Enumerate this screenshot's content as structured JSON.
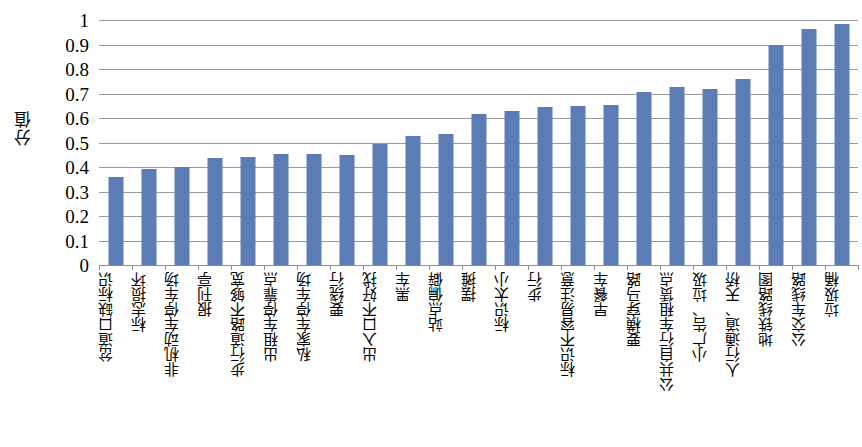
{
  "chart_data": {
    "type": "bar",
    "title": "",
    "subtitle": "",
    "xlabel": "",
    "ylabel": "分值",
    "ylim": [
      0,
      1
    ],
    "ytick_labels": [
      "1",
      "0.9",
      "0.8",
      "0.7",
      "0.6",
      "0.5",
      "0.4",
      "0.3",
      "0.2",
      "0.1",
      "0"
    ],
    "ytick_values": [
      1,
      0.9,
      0.8,
      0.7,
      0.6,
      0.5,
      0.4,
      0.3,
      0.2,
      0.1,
      0
    ],
    "grid": true,
    "legend": null,
    "legend_position": "none",
    "bar_color": "#5b7cb4",
    "gridline_color": "#9a9a9a",
    "categories": [
      "岔道口缺标识",
      "标志损坏",
      "非机动车停车场",
      "报刊亭",
      "步行道路不够宽",
      "出租车停靠点",
      "私家车停车场",
      "要绕行",
      "出入口不好找",
      "黑车",
      "站点偏僻",
      "摆摊",
      "标识太小",
      "步行",
      "标识不容易注意",
      "早餐车",
      "要横穿马路",
      "公共自行车租赁点",
      "小广告、垃圾",
      "人行通道、天桥",
      "地铁线路图",
      "公交车线路",
      "垃圾桶"
    ],
    "values": [
      0.36,
      0.39,
      0.4,
      0.435,
      0.44,
      0.455,
      0.455,
      0.45,
      0.495,
      0.525,
      0.535,
      0.615,
      0.63,
      0.645,
      0.65,
      0.655,
      0.705,
      0.725,
      0.72,
      0.76,
      0.9,
      0.965,
      0.985
    ]
  }
}
